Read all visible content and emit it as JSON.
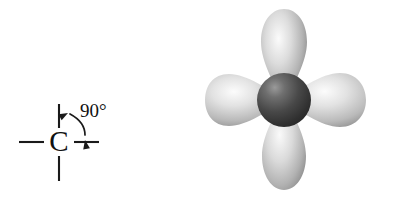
{
  "figure": {
    "background_color": "#ffffff",
    "width": 398,
    "height": 200,
    "panels": [
      "skeletal-structure",
      "orbital-diagram"
    ]
  },
  "skeletal": {
    "atom_label": "C",
    "angle_label": "90°",
    "bond_color": "#1a1a1a",
    "text_color": "#111111",
    "bonds": [
      {
        "name": "bond-up",
        "x1": 59,
        "y1": 104,
        "x2": 59,
        "y2": 128
      },
      {
        "name": "bond-down",
        "x1": 59,
        "y1": 155,
        "x2": 59,
        "y2": 180
      },
      {
        "name": "bond-left",
        "x1": 19,
        "y1": 142,
        "x2": 44,
        "y2": 142
      },
      {
        "name": "bond-right",
        "x1": 74,
        "y1": 142,
        "x2": 99,
        "y2": 142
      }
    ],
    "atom_center": {
      "x": 59,
      "y": 143
    },
    "angle_label_pos": {
      "x": 80,
      "y": 113
    },
    "arc": {
      "path": "M 68 113 Q 84 122 85 137",
      "head_start": {
        "x": 68,
        "y": 113,
        "rotation": -125
      },
      "head_end": {
        "x": 86,
        "y": 140,
        "rotation": 78
      }
    }
  },
  "orbital": {
    "name": "four-lobe-orbital",
    "nucleus": {
      "name": "nucleus-sphere",
      "cx": 85,
      "cy": 100,
      "r": 27,
      "color_light": "#8d8d8d",
      "color_mid": "#4a4a4a",
      "color_dark": "#2b2b2b"
    },
    "lobes": [
      {
        "name": "lobe-up",
        "direction": "up",
        "tip": {
          "x": 85,
          "y": 100
        },
        "bulb": {
          "x": 85,
          "y": 26
        },
        "half_width": 22,
        "color_light": "#f2f2f2",
        "color_mid": "#b8b8b8",
        "color_dark": "#8a8a8a"
      },
      {
        "name": "lobe-down",
        "direction": "down",
        "tip": {
          "x": 85,
          "y": 100
        },
        "bulb": {
          "x": 85,
          "y": 176
        },
        "half_width": 22,
        "color_light": "#f2f2f2",
        "color_mid": "#b8b8b8",
        "color_dark": "#8a8a8a"
      },
      {
        "name": "lobe-left",
        "direction": "left",
        "tip": {
          "x": 85,
          "y": 100
        },
        "bulb": {
          "x": 8,
          "y": 100
        },
        "half_width": 21,
        "color_light": "#f4f4f4",
        "color_mid": "#bcbcbc",
        "color_dark": "#8d8d8d"
      },
      {
        "name": "lobe-right",
        "direction": "right",
        "tip": {
          "x": 85,
          "y": 100
        },
        "bulb": {
          "x": 166,
          "y": 100
        },
        "half_width": 21,
        "color_light": "#f4f4f4",
        "color_mid": "#bcbcbc",
        "color_dark": "#8d8d8d"
      }
    ]
  }
}
